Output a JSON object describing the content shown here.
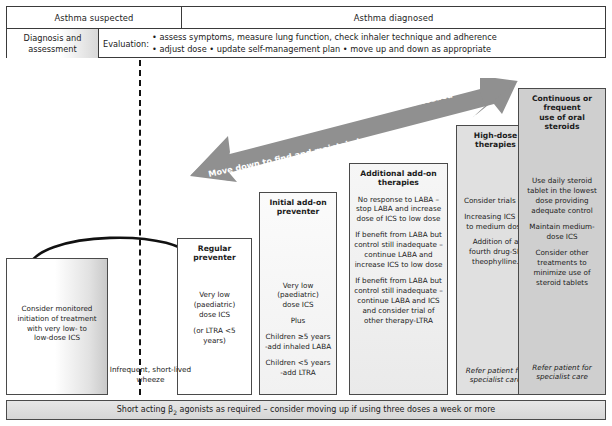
{
  "header": {
    "suspected_label": "Asthma suspected",
    "diagnosed_label": "Asthma diagnosed",
    "assessment_line1": "Diagnosis and",
    "assessment_line2": "assessment",
    "evaluation_label": "Evaluation:",
    "evaluation_line1": "• assess symptoms, measure lung function, check inhaler technique and adherence",
    "evaluation_line2": "• adjust dose  • update self-management plan  • move up and down as appropriate"
  },
  "arrows": {
    "up_label": "Move up to improve control as needed",
    "down_label": "Move down to find and maintain lowest controlling therapy",
    "arrow_color": "#909090"
  },
  "wheeze_note": {
    "line1": "Infrequent, short-lived",
    "line2": "wheeze"
  },
  "steps": [
    {
      "id": "consider",
      "title": "",
      "body": [
        "Consider monitored",
        "initiation of treatment",
        "with very low- to",
        "low-dose ICS"
      ],
      "refer": ""
    },
    {
      "id": "regular",
      "title": "Regular preventer",
      "body_paras": [
        "Very low (paediatric)\ndose ICS",
        "(or  LTRA <5 years)"
      ],
      "refer": ""
    },
    {
      "id": "initial",
      "title": "Initial add-on preventer",
      "body_paras": [
        "Very low (paediatric)\ndose ICS",
        "Plus",
        "Children ≥5 years\n-add inhaled LABA",
        "Children <5 years\n-add LTRA"
      ],
      "refer": ""
    },
    {
      "id": "additional",
      "title": "Additional add-on\ntherapies",
      "body_paras": [
        "No response to LABA – stop LABA and increase dose of ICS to low dose",
        "If benefit from LABA but control still inadequate – continue LABA and increase ICS to low dose",
        "If benefit from LABA but control still inadequate – continue LABA and ICS and consider trial of other therapy-LTRA"
      ],
      "refer": ""
    },
    {
      "id": "highdose",
      "title": "High-dose therapies",
      "body_paras": [
        "Consider trials of:",
        "Increasing ICS up to medium dose",
        "Addition of a fourth drug-SR theophylline."
      ],
      "refer": "Refer patient for\nspecialist care"
    },
    {
      "id": "oral",
      "title": "Continuous or frequent\nuse of oral steroids",
      "body_paras": [
        "Use daily steroid tablet in the lowest dose providing adequate control",
        "Maintain medium-dose ICS",
        "Consider other treatments to minimize use of steroid tablets"
      ],
      "refer": "Refer patient for\nspecialist care"
    }
  ],
  "bottom_bar": {
    "text_before": "Short acting β",
    "subscript": "2",
    "text_after": " agonists as required – consider moving up if using three doses a week or more"
  }
}
